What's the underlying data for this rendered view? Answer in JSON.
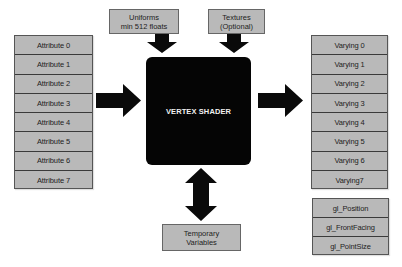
{
  "diagram": {
    "title": "VERTEX SHADER",
    "inputs": {
      "uniforms": [
        "Uniforms",
        "min 512 floats"
      ],
      "textures": [
        "Textures",
        "(Optional)"
      ],
      "attributes": [
        "Attribute 0",
        "Attribute 1",
        "Attribute 2",
        "Attribute 3",
        "Attribute 4",
        "Attribute 5",
        "Attribute 6",
        "Attribute 7"
      ]
    },
    "outputs": {
      "varyings": [
        "Varying 0",
        "Varying 1",
        "Varying 2",
        "Varying 3",
        "Varying 4",
        "Varying 5",
        "Varying 6",
        "Varying7"
      ],
      "builtins": [
        "gl_Position",
        "gl_FrontFacing",
        "gl_PointSize"
      ]
    },
    "temporary": [
      "Temporary",
      "Variables"
    ],
    "colors": {
      "box_fill": "#b9b9b9",
      "shader_fill": "#050505",
      "arrow": "#0a0a0a",
      "divider": "#3a3a3a"
    }
  }
}
